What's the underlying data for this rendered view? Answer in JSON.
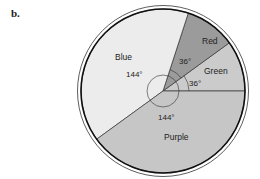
{
  "panel_label": "b.",
  "chart_data": {
    "type": "pie",
    "title": "",
    "categories": [
      "Green",
      "Red",
      "Blue",
      "Purple"
    ],
    "values": [
      36,
      36,
      144,
      144
    ],
    "unit": "degrees",
    "slices": [
      {
        "label": "Green",
        "angle": 36,
        "angle_label": "36°",
        "start_deg": 0,
        "end_deg": 36,
        "fill": "#cbcbcb"
      },
      {
        "label": "Red",
        "angle": 36,
        "angle_label": "36°",
        "start_deg": 36,
        "end_deg": 72,
        "fill": "#9b9b9b"
      },
      {
        "label": "Blue",
        "angle": 144,
        "angle_label": "144°",
        "start_deg": 72,
        "end_deg": 216,
        "fill": "#ececec"
      },
      {
        "label": "Purple",
        "angle": 144,
        "angle_label": "144°",
        "start_deg": 216,
        "end_deg": 360,
        "fill": "#c6c6c6"
      }
    ],
    "legend": "none (labels inside slices)",
    "grid": false
  }
}
